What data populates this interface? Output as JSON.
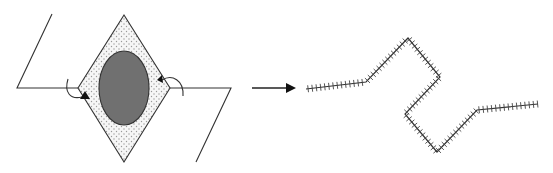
{
  "diagram": {
    "title": "",
    "colors": {
      "line": "#333333",
      "ellipse_fill": "#707070",
      "diamond_fill": "#f4f4f4",
      "dot": "#9a9a9a",
      "background": "#ffffff"
    },
    "left_figure": {
      "left_chain_points": "52,14 17,88 78,88",
      "right_chain_points": "170,88 231,88 196,162",
      "diamond_points": "124,15 170,88 124,162 78,88",
      "ellipse": {
        "cx": 124,
        "cy": 88,
        "rx": 25,
        "ry": 37
      },
      "rotation_arrows": [
        {
          "name": "left-rotation-arrow",
          "path": "M68,79 C64,92 70,100 82,97",
          "head": "85,91 80,99 90,99"
        },
        {
          "name": "right-rotation-arrow",
          "path": "M183,96 C184,80 172,74 162,80",
          "head": "157,80 162,75 163,83"
        }
      ]
    },
    "transform_arrow": {
      "x1": 252,
      "y1": 88,
      "x2": 290,
      "y2": 88
    },
    "right_figure": {
      "hatched_chain_points": [
        [
          306,
          89
        ],
        [
          366,
          82
        ],
        [
          408,
          38
        ],
        [
          440,
          77
        ],
        [
          405,
          114
        ],
        [
          437,
          152
        ],
        [
          477,
          110
        ],
        [
          538,
          104
        ]
      ]
    }
  }
}
